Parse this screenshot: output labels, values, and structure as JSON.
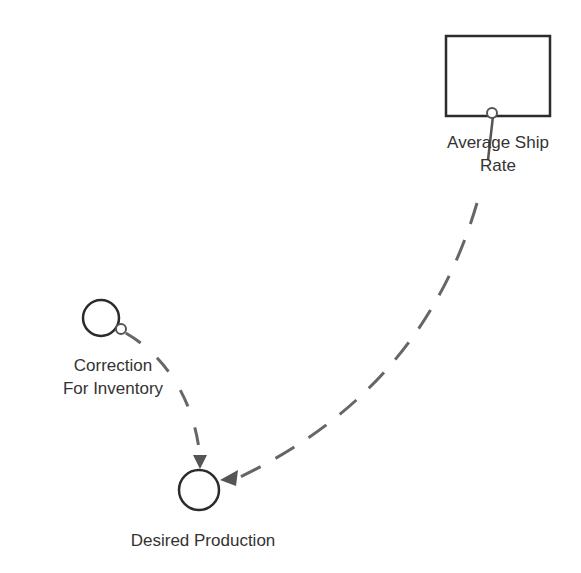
{
  "diagram": {
    "type": "stock-and-flow",
    "colors": {
      "node_stroke": "#2b2b2b",
      "link_stroke": "#666666",
      "label_text": "#333333",
      "background": "#ffffff"
    },
    "nodes": [
      {
        "id": "average-ship-rate",
        "kind": "stock",
        "label_line1": "Average Ship",
        "label_line2": "Rate"
      },
      {
        "id": "correction-for-inventory",
        "kind": "converter",
        "label_line1": "Correction",
        "label_line2": "For Inventory"
      },
      {
        "id": "desired-production",
        "kind": "converter",
        "label_line1": "Desired Production"
      }
    ],
    "links": [
      {
        "from": "average-ship-rate",
        "to": "desired-production",
        "style": "dashed",
        "arrow": "end"
      },
      {
        "from": "correction-for-inventory",
        "to": "desired-production",
        "style": "dashed",
        "arrow": "end"
      }
    ]
  }
}
